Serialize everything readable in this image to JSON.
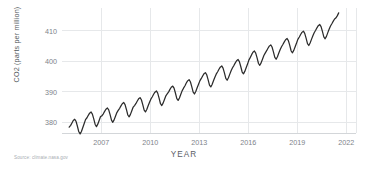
{
  "source_note": "Source: climate.nasa.gov",
  "chart_data": {
    "type": "line",
    "title": "",
    "subtitle": "",
    "xlabel": "YEAR",
    "ylabel": "CO2 (parts per million)",
    "xlim": [
      2004.6,
      2022.6
    ],
    "ylim": [
      376.5,
      417.5
    ],
    "xticks": [
      2007,
      2010,
      2013,
      2016,
      2019,
      2022
    ],
    "xtick_labels": [
      "2007",
      "2010",
      "2013",
      "2016",
      "2019",
      "2022"
    ],
    "yticks": [
      380,
      390,
      400,
      410
    ],
    "ytick_labels": [
      "380",
      "390",
      "400",
      "410"
    ],
    "grid": "both-light",
    "legend": "none",
    "line_color": "#2b2b2b",
    "grid_color": "#e6e8ea",
    "series": [
      {
        "name": "Atmospheric CO2 concentration (monthly mean)",
        "x": [
          2005.04,
          2005.13,
          2005.21,
          2005.29,
          2005.38,
          2005.46,
          2005.54,
          2005.63,
          2005.71,
          2005.79,
          2005.88,
          2005.96,
          2006.04,
          2006.13,
          2006.21,
          2006.29,
          2006.38,
          2006.46,
          2006.54,
          2006.63,
          2006.71,
          2006.79,
          2006.88,
          2006.96,
          2007.04,
          2007.13,
          2007.21,
          2007.29,
          2007.38,
          2007.46,
          2007.54,
          2007.63,
          2007.71,
          2007.79,
          2007.88,
          2007.96,
          2008.04,
          2008.13,
          2008.21,
          2008.29,
          2008.38,
          2008.46,
          2008.54,
          2008.63,
          2008.71,
          2008.79,
          2008.88,
          2008.96,
          2009.04,
          2009.13,
          2009.21,
          2009.29,
          2009.38,
          2009.46,
          2009.54,
          2009.63,
          2009.71,
          2009.79,
          2009.88,
          2009.96,
          2010.04,
          2010.13,
          2010.21,
          2010.29,
          2010.38,
          2010.46,
          2010.54,
          2010.63,
          2010.71,
          2010.79,
          2010.88,
          2010.96,
          2011.04,
          2011.13,
          2011.21,
          2011.29,
          2011.38,
          2011.46,
          2011.54,
          2011.63,
          2011.71,
          2011.79,
          2011.88,
          2011.96,
          2012.04,
          2012.13,
          2012.21,
          2012.29,
          2012.38,
          2012.46,
          2012.54,
          2012.63,
          2012.71,
          2012.79,
          2012.88,
          2012.96,
          2013.04,
          2013.13,
          2013.21,
          2013.29,
          2013.38,
          2013.46,
          2013.54,
          2013.63,
          2013.71,
          2013.79,
          2013.88,
          2013.96,
          2014.04,
          2014.13,
          2014.21,
          2014.29,
          2014.38,
          2014.46,
          2014.54,
          2014.63,
          2014.71,
          2014.79,
          2014.88,
          2014.96,
          2015.04,
          2015.13,
          2015.21,
          2015.29,
          2015.38,
          2015.46,
          2015.54,
          2015.63,
          2015.71,
          2015.79,
          2015.88,
          2015.96,
          2016.04,
          2016.13,
          2016.21,
          2016.29,
          2016.38,
          2016.46,
          2016.54,
          2016.63,
          2016.71,
          2016.79,
          2016.88,
          2016.96,
          2017.04,
          2017.13,
          2017.21,
          2017.29,
          2017.38,
          2017.46,
          2017.54,
          2017.63,
          2017.71,
          2017.79,
          2017.88,
          2017.96,
          2018.04,
          2018.13,
          2018.21,
          2018.29,
          2018.38,
          2018.46,
          2018.54,
          2018.63,
          2018.71,
          2018.79,
          2018.88,
          2018.96,
          2019.04,
          2019.13,
          2019.21,
          2019.29,
          2019.38,
          2019.46,
          2019.54,
          2019.63,
          2019.71,
          2019.79,
          2019.88,
          2019.96,
          2020.04,
          2020.13,
          2020.21,
          2020.29,
          2020.38,
          2020.46,
          2020.54,
          2020.63,
          2020.71,
          2020.79,
          2020.88,
          2020.96,
          2021.04,
          2021.13,
          2021.21,
          2021.29,
          2021.38,
          2021.46,
          2021.54
        ],
        "y": [
          378.4,
          379.0,
          379.8,
          380.6,
          381.0,
          380.3,
          378.8,
          376.9,
          376.2,
          377.0,
          378.4,
          379.6,
          380.9,
          381.5,
          382.3,
          383.0,
          383.4,
          382.7,
          381.2,
          379.3,
          378.6,
          379.4,
          380.7,
          381.9,
          382.1,
          382.8,
          383.6,
          384.3,
          384.7,
          384.1,
          382.6,
          380.7,
          380.0,
          380.8,
          382.1,
          383.2,
          383.9,
          384.6,
          385.4,
          386.1,
          386.5,
          385.8,
          384.3,
          382.4,
          381.8,
          382.6,
          383.9,
          385.0,
          385.5,
          386.2,
          387.0,
          387.7,
          388.1,
          387.4,
          385.9,
          384.0,
          383.4,
          384.2,
          385.5,
          386.6,
          387.6,
          388.4,
          389.2,
          389.9,
          390.3,
          389.6,
          388.0,
          386.1,
          385.5,
          386.3,
          387.6,
          388.7,
          389.3,
          390.0,
          390.8,
          391.5,
          391.9,
          391.2,
          389.7,
          387.8,
          387.2,
          388.0,
          389.3,
          390.4,
          391.2,
          392.0,
          392.9,
          393.6,
          394.0,
          393.3,
          391.8,
          389.9,
          389.3,
          390.1,
          391.4,
          392.5,
          393.6,
          394.4,
          395.2,
          395.9,
          396.3,
          395.6,
          394.1,
          392.2,
          391.6,
          392.4,
          393.7,
          394.8,
          395.8,
          396.6,
          397.4,
          398.1,
          398.5,
          397.8,
          396.3,
          394.4,
          393.8,
          394.6,
          395.9,
          397.0,
          397.9,
          398.7,
          399.5,
          400.2,
          400.6,
          399.9,
          398.4,
          396.5,
          395.9,
          396.7,
          398.0,
          399.1,
          400.4,
          401.3,
          402.2,
          403.0,
          403.4,
          402.7,
          401.2,
          399.3,
          398.7,
          399.5,
          400.8,
          401.9,
          402.7,
          403.5,
          404.3,
          405.0,
          405.4,
          404.7,
          403.2,
          401.3,
          400.7,
          401.5,
          402.8,
          403.9,
          404.8,
          405.6,
          406.4,
          407.1,
          407.5,
          406.8,
          405.3,
          403.4,
          402.8,
          403.6,
          404.9,
          406.0,
          407.2,
          408.0,
          408.8,
          409.5,
          409.9,
          409.2,
          407.7,
          405.8,
          405.2,
          406.0,
          407.3,
          408.4,
          409.4,
          410.2,
          411.0,
          411.7,
          412.1,
          411.4,
          409.9,
          408.0,
          407.4,
          408.2,
          409.5,
          410.6,
          411.6,
          412.4,
          413.2,
          413.9,
          414.3,
          415.0,
          415.9
        ]
      }
    ]
  }
}
